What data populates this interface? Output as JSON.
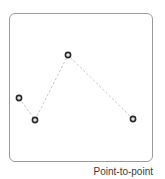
{
  "diagram": {
    "caption": "Point-to-point",
    "frame": {
      "x": 9,
      "y": 13,
      "width": 144,
      "height": 149,
      "border_color": "#9a9a9a"
    },
    "line": {
      "style": "dashed",
      "color": "#c8c8c8"
    },
    "marker": {
      "ring_color": "#2a2a2a",
      "fill_color": "#e6e6e6",
      "radius": 2.6
    },
    "points": [
      {
        "x": 19,
        "y": 98
      },
      {
        "x": 35,
        "y": 120
      },
      {
        "x": 68,
        "y": 55
      },
      {
        "x": 133,
        "y": 119
      }
    ]
  }
}
